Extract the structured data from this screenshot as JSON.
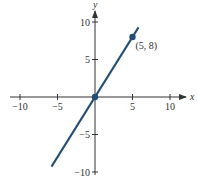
{
  "chart_data": {
    "type": "line",
    "title": "",
    "xlabel": "x",
    "ylabel": "y",
    "xlim": [
      -11,
      12
    ],
    "ylim": [
      -11,
      12
    ],
    "x_ticks": [
      -10,
      -5,
      5,
      10
    ],
    "y_ticks": [
      10,
      5,
      -5,
      -10
    ],
    "x_tick_labels": [
      "−10",
      "−5",
      "5",
      "10"
    ],
    "y_tick_labels": [
      "10",
      "5",
      "−5",
      "−10"
    ],
    "grid": false,
    "series": [
      {
        "name": "y = (8/5)x",
        "x": [
          -5.8,
          5.8
        ],
        "y": [
          -9.28,
          9.28
        ],
        "color": "#1f4e79"
      }
    ],
    "points": [
      {
        "x": 0,
        "y": 0,
        "label": ""
      },
      {
        "x": 5,
        "y": 8,
        "label": "(5, 8)"
      }
    ]
  },
  "colors": {
    "axis": "#333333",
    "line": "#1f4e79"
  }
}
